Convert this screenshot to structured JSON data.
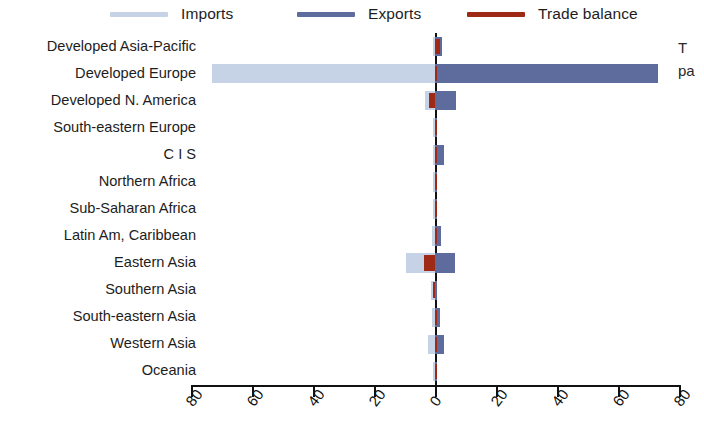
{
  "legend": {
    "items": [
      {
        "label": "Imports",
        "color": "#c6d3e6",
        "name": "imports"
      },
      {
        "label": "Exports",
        "color": "#5d6c9c",
        "name": "exports"
      },
      {
        "label": "Trade balance",
        "color": "#9e2a16",
        "name": "trade-balance"
      }
    ]
  },
  "side_note": {
    "line1": "T",
    "line2": "pa"
  },
  "axis": {
    "tick_labels": [
      "80",
      "60",
      "40",
      "20",
      "0",
      "20",
      "40",
      "60",
      "80"
    ],
    "tick_values": [
      -80,
      -60,
      -40,
      -20,
      0,
      20,
      40,
      60,
      80
    ]
  },
  "chart_data": {
    "type": "bar",
    "orientation": "horizontal",
    "title": "",
    "xlabel": "",
    "ylabel": "",
    "xlim": [
      -80,
      80
    ],
    "grid": false,
    "legend_position": "top",
    "categories": [
      "Developed Asia-Pacific",
      "Developed Europe",
      "Developed N. America",
      "South-eastern Europe",
      "C I S",
      "Northern Africa",
      "Sub-Saharan Africa",
      "Latin Am, Caribbean",
      "Eastern Asia",
      "Southern Asia",
      "South-eastern Asia",
      "Western Asia",
      "Oceania"
    ],
    "series": [
      {
        "name": "Imports",
        "color": "#c6d3e6",
        "note": "plotted as negative values to the left of zero",
        "values": [
          -0.8,
          -73.0,
          -3.2,
          -0.4,
          -0.6,
          -0.3,
          -0.4,
          -1.0,
          -9.5,
          -1.2,
          -1.0,
          -2.2,
          -0.2
        ]
      },
      {
        "name": "Exports",
        "color": "#5d6c9c",
        "values": [
          2.3,
          73.0,
          7.0,
          0.5,
          3.0,
          0.5,
          0.6,
          2.0,
          6.5,
          0.6,
          1.8,
          2.8,
          0.3
        ]
      },
      {
        "name": "Trade balance",
        "color": "#9e2a16",
        "values": [
          1.5,
          0.6,
          -2.0,
          0.2,
          0.4,
          0.2,
          0.3,
          0.4,
          -3.5,
          -0.8,
          0.5,
          0.8,
          0.1
        ]
      }
    ]
  }
}
